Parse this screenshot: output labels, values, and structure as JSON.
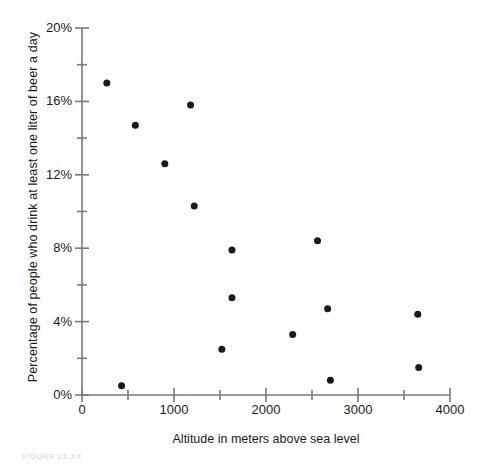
{
  "chart_data": {
    "type": "scatter",
    "title": "",
    "xlabel": "Altitude in meters above sea level",
    "ylabel": "Percentage of people who drink at least one liter of beer a day",
    "xlim": [
      0,
      4000
    ],
    "ylim": [
      0,
      20
    ],
    "xticks": [
      0,
      1000,
      2000,
      3000,
      4000
    ],
    "xtick_labels": [
      "0",
      "1000",
      "2000",
      "3000",
      "4000"
    ],
    "yticks": [
      0,
      4,
      8,
      12,
      16,
      20
    ],
    "ytick_labels": [
      "0%",
      "4%",
      "8%",
      "12%",
      "16%",
      "20%"
    ],
    "yminor_ticks": [
      2,
      6,
      10,
      14,
      18
    ],
    "xminor_ticks": [
      500,
      1500,
      2500,
      3500
    ],
    "grid": false,
    "legend": false,
    "marker_color": "#1a1a1a",
    "axis_color": "#7a7a7a",
    "points": [
      {
        "x": 270,
        "y": 17.0
      },
      {
        "x": 430,
        "y": 0.5
      },
      {
        "x": 580,
        "y": 14.7
      },
      {
        "x": 900,
        "y": 12.6
      },
      {
        "x": 1180,
        "y": 15.8
      },
      {
        "x": 1220,
        "y": 10.3
      },
      {
        "x": 1520,
        "y": 2.5
      },
      {
        "x": 1630,
        "y": 7.9
      },
      {
        "x": 1630,
        "y": 5.3
      },
      {
        "x": 2290,
        "y": 3.3
      },
      {
        "x": 2560,
        "y": 8.4
      },
      {
        "x": 2670,
        "y": 4.7
      },
      {
        "x": 2700,
        "y": 0.8
      },
      {
        "x": 3650,
        "y": 4.4
      },
      {
        "x": 3660,
        "y": 1.5
      }
    ]
  },
  "figure": {
    "caption": "FIGURE 2X.XX"
  }
}
